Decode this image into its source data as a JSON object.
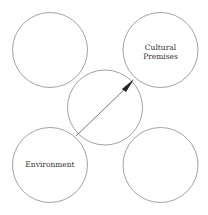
{
  "diagram": {
    "circles": [
      {
        "id": "top-left",
        "label": "",
        "cx": 50,
        "cy": 50,
        "r": 37.5
      },
      {
        "id": "top-right",
        "label_lines": [
          "Cultural",
          "Premises"
        ],
        "cx": 160.5,
        "cy": 50,
        "r": 37.5
      },
      {
        "id": "center",
        "label": "",
        "cx": 105,
        "cy": 107.5,
        "r": 37.5
      },
      {
        "id": "bottom-left",
        "label": "Environment",
        "cx": 50,
        "cy": 165,
        "r": 37.5
      },
      {
        "id": "bottom-right",
        "label": "",
        "cx": 160.5,
        "cy": 165,
        "r": 37.5
      }
    ],
    "arrow": {
      "from": "Environment",
      "to": "Cultural Premises"
    },
    "labels": {
      "cultural": "Cultural",
      "premises": "Premises",
      "environment": "Environment"
    },
    "colors": {
      "stroke": "#888888",
      "arrow": "#222222",
      "text": "#333333"
    }
  }
}
